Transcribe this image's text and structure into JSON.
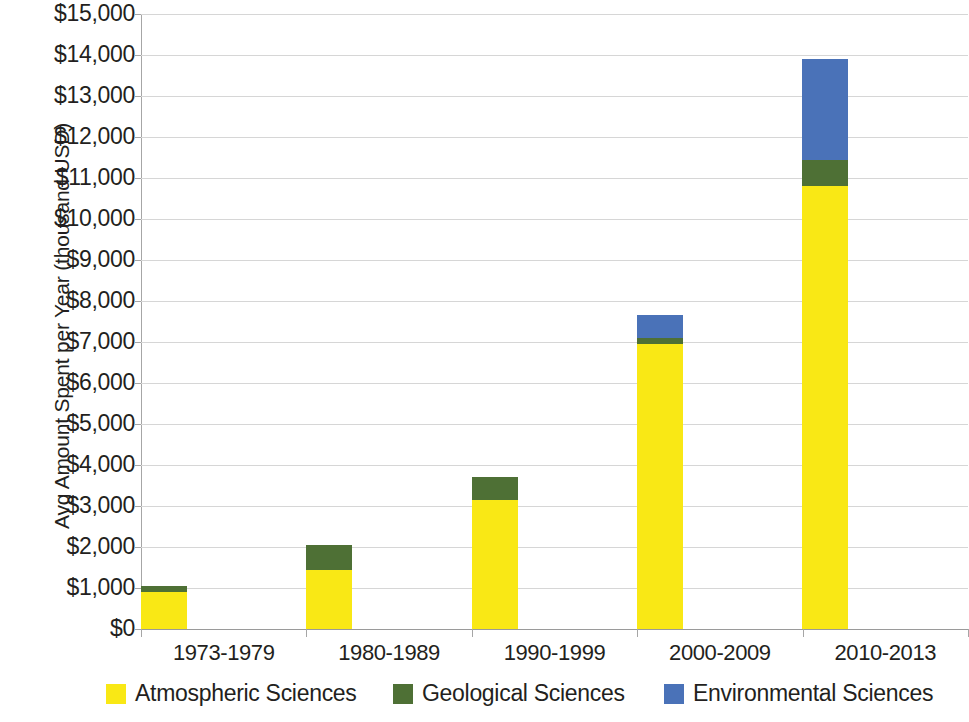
{
  "chart_data": {
    "type": "bar",
    "stacked": true,
    "title": "",
    "xlabel": "",
    "ylabel": "Avg Amount Spent per Year (thousand USD)",
    "categories": [
      "1973-1979",
      "1980-1989",
      "1990-1999",
      "2000-2009",
      "2010-2013"
    ],
    "series": [
      {
        "name": "Atmospheric Sciences",
        "color": "#f9e815",
        "values": [
          900,
          1450,
          3150,
          6950,
          10800
        ]
      },
      {
        "name": "Geological Sciences",
        "color": "#4e7035",
        "values": [
          150,
          600,
          550,
          150,
          650
        ]
      },
      {
        "name": "Environmental Sciences",
        "color": "#4a72b8",
        "values": [
          0,
          0,
          0,
          550,
          2450
        ]
      }
    ],
    "totals": [
      1050,
      2050,
      3700,
      7650,
      13900
    ],
    "ylim": [
      0,
      15000
    ],
    "ytick_values": [
      0,
      1000,
      2000,
      3000,
      4000,
      5000,
      6000,
      7000,
      8000,
      9000,
      10000,
      11000,
      12000,
      13000,
      14000,
      15000
    ],
    "ytick_labels": [
      "$0",
      "$1,000",
      "$2,000",
      "$3,000",
      "$4,000",
      "$5,000",
      "$6,000",
      "$7,000",
      "$8,000",
      "$9,000",
      "$10,000",
      "$11,000",
      "$12,000",
      "$13,000",
      "$14,000",
      "$15,000"
    ],
    "grid": true,
    "legend_position": "bottom"
  },
  "legend": {
    "items": [
      {
        "label": "Atmospheric Sciences",
        "color": "#f9e815"
      },
      {
        "label": "Geological Sciences",
        "color": "#4e7035"
      },
      {
        "label": "Environmental Sciences",
        "color": "#4a72b8"
      }
    ]
  },
  "axes": {
    "y_title": "Avg Amount Spent per Year (thousand USD)"
  }
}
